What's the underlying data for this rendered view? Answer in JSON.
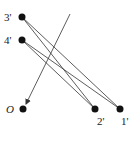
{
  "diagram": {
    "points": [
      {
        "id": "p3",
        "label": "3'",
        "x": 22,
        "y": 17,
        "lx": 4,
        "ly": 21
      },
      {
        "id": "p4",
        "label": "4'",
        "x": 22,
        "y": 40,
        "lx": 4,
        "ly": 44
      },
      {
        "id": "pO",
        "label": "O",
        "x": 23,
        "y": 109,
        "lx": 6,
        "ly": 113,
        "italic": true
      },
      {
        "id": "p2",
        "label": "2'",
        "x": 95,
        "y": 109,
        "lx": 97,
        "ly": 125
      },
      {
        "id": "p1",
        "label": "1'",
        "x": 120,
        "y": 109,
        "lx": 121,
        "ly": 125
      }
    ],
    "edges": [
      {
        "from": "p3",
        "to": "p2"
      },
      {
        "from": "p3",
        "to": "p1"
      },
      {
        "from": "p4",
        "to": "p2"
      },
      {
        "from": "p4",
        "to": "p1"
      }
    ],
    "arrow": {
      "x1": 70,
      "y1": 14,
      "x2": 26,
      "y2": 104
    },
    "colors": {
      "line": "#333333",
      "point": "#111111"
    }
  }
}
